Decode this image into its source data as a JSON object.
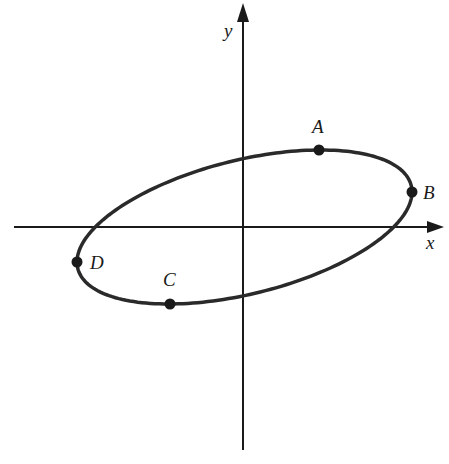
{
  "diagram": {
    "type": "ellipse-on-axes",
    "axes": {
      "x_label": "x",
      "y_label": "y",
      "origin_px": [
        243,
        227
      ],
      "color": "#1a1a1a"
    },
    "ellipse": {
      "center_px": [
        244.5,
        227
      ],
      "P": 167.5,
      "Q": -35,
      "R": -68.6,
      "stroke": "#2a2a2a",
      "stroke_width": 3.5
    },
    "points": [
      {
        "label": "A",
        "x": 319,
        "y": 150,
        "label_x": 312,
        "label_y": 133
      },
      {
        "label": "B",
        "x": 412,
        "y": 192,
        "label_x": 423,
        "label_y": 199
      },
      {
        "label": "C",
        "x": 170,
        "y": 304,
        "label_x": 163,
        "label_y": 286
      },
      {
        "label": "D",
        "x": 77,
        "y": 262,
        "label_x": 90,
        "label_y": 269
      }
    ]
  }
}
